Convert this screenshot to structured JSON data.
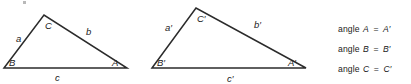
{
  "figure": {
    "background_color": "#ffffff",
    "stroke_color": "#2b2b2b",
    "label_color": "#222222",
    "triangles": [
      {
        "name": "triangle-abc",
        "vertices": {
          "B": {
            "x": 4,
            "y": 68
          },
          "C": {
            "x": 44,
            "y": 15
          },
          "A": {
            "x": 127,
            "y": 68
          }
        },
        "vertex_labels": [
          {
            "text": "B",
            "x": 9,
            "y": 66
          },
          {
            "text": "C",
            "x": 45,
            "y": 29
          },
          {
            "text": "A",
            "x": 112,
            "y": 66
          }
        ],
        "side_labels": [
          {
            "text": "a",
            "x": 16,
            "y": 42
          },
          {
            "text": "b",
            "x": 86,
            "y": 35
          },
          {
            "text": "c",
            "x": 55,
            "y": 81
          }
        ]
      },
      {
        "name": "triangle-abc-prime",
        "vertices": {
          "B'": {
            "x": 152,
            "y": 68
          },
          "C'": {
            "x": 196,
            "y": 8
          },
          "A'": {
            "x": 306,
            "y": 68
          }
        },
        "vertex_labels": [
          {
            "text": "B′",
            "x": 157,
            "y": 66
          },
          {
            "text": "C′",
            "x": 197,
            "y": 22
          },
          {
            "text": "A′",
            "x": 288,
            "y": 66
          }
        ],
        "side_labels": [
          {
            "text": "a′",
            "x": 165,
            "y": 31
          },
          {
            "text": "b′",
            "x": 254,
            "y": 28
          },
          {
            "text": "c′",
            "x": 227,
            "y": 82
          }
        ]
      }
    ]
  },
  "equations": {
    "rows": [
      {
        "word": "angle",
        "left": "A",
        "rel": "=",
        "right": "A′"
      },
      {
        "word": "angle",
        "left": "B",
        "rel": "=",
        "right": "B′"
      },
      {
        "word": "angle",
        "left": "C",
        "rel": "=",
        "right": "C′"
      }
    ]
  }
}
